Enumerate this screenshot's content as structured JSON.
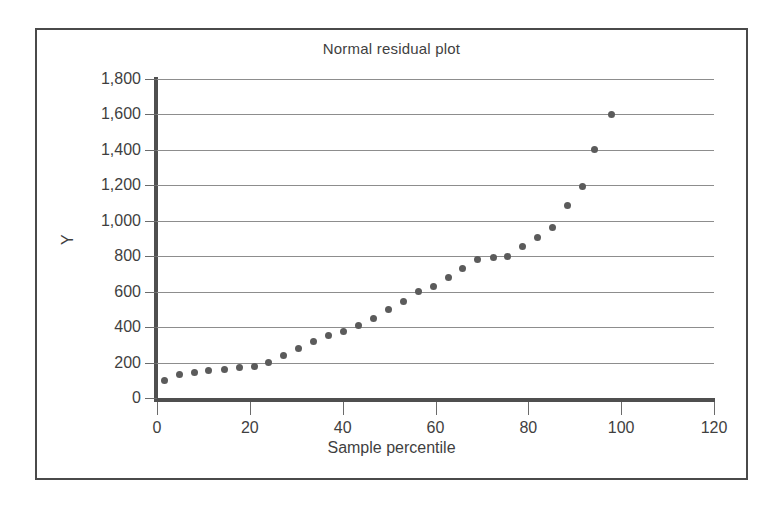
{
  "chart_data": {
    "type": "scatter",
    "title": "Normal residual plot",
    "xlabel": "Sample percentile",
    "ylabel": "Y",
    "xlim": [
      0,
      120
    ],
    "ylim": [
      0,
      1800
    ],
    "xticks": [
      0,
      20,
      40,
      60,
      80,
      100,
      120
    ],
    "xtick_labels": [
      "0",
      "20",
      "40",
      "60",
      "80",
      "100",
      "120"
    ],
    "yticks": [
      0,
      200,
      400,
      600,
      800,
      1000,
      1200,
      1400,
      1600,
      1800
    ],
    "ytick_labels": [
      "0",
      "200",
      "400",
      "600",
      "800",
      "1,000",
      "1,200",
      "1,400",
      "1,600",
      "1,800"
    ],
    "grid": "horizontal",
    "legend": null,
    "marker_color": "#5b5b5b",
    "series": [
      {
        "name": "residuals",
        "x": [
          1.6,
          4.8,
          8.0,
          11.2,
          14.5,
          17.7,
          20.9,
          24.1,
          27.3,
          30.5,
          33.8,
          37.0,
          40.2,
          43.4,
          46.6,
          49.8,
          53.1,
          56.3,
          59.5,
          62.7,
          65.9,
          69.1,
          72.4,
          75.6,
          78.8,
          82.0,
          85.2,
          88.4,
          91.6,
          94.3,
          98.0
        ],
        "y": [
          100,
          130,
          145,
          155,
          160,
          170,
          175,
          200,
          240,
          280,
          320,
          355,
          375,
          410,
          450,
          500,
          545,
          600,
          630,
          680,
          730,
          780,
          790,
          800,
          855,
          905,
          960,
          1085,
          1195,
          1400,
          1600
        ]
      }
    ]
  },
  "figure": {
    "border_color": "#4a4a4a",
    "background": "#ffffff"
  }
}
